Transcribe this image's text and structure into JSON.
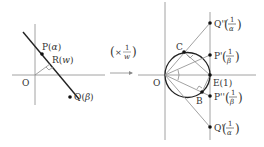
{
  "left_figure": {
    "origin_label": "O",
    "points": {
      "P": {
        "name": "P",
        "value": "α"
      },
      "R": {
        "name": "R",
        "value": "w"
      },
      "Q": {
        "name": "Q",
        "value": "β"
      }
    }
  },
  "transform": {
    "open": "(",
    "times": "×",
    "numerator": "1",
    "denominator": "w",
    "close": ")"
  },
  "right_figure": {
    "origin_label": "O",
    "points": {
      "C": {
        "name": "C"
      },
      "B": {
        "name": "B"
      },
      "E": {
        "name": "E",
        "value": "(1)"
      },
      "Q2": {
        "name": "Q''",
        "numerator": "1",
        "denominator": "α"
      },
      "P1": {
        "name": "P'",
        "numerator": "1",
        "denominator": "β"
      },
      "P2": {
        "name": "P''",
        "numerator": "1",
        "denominator": "β"
      },
      "Q1": {
        "name": "Q'",
        "numerator": "1",
        "denominator": "α"
      }
    }
  },
  "colors": {
    "axis": "#8a8a8a",
    "line": "#222222",
    "text": "#333333"
  }
}
